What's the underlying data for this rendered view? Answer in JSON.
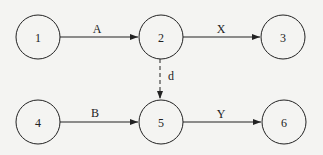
{
  "diagram": {
    "type": "activity-network",
    "colors": {
      "background": "#f4f4f2",
      "stroke": "#222222"
    },
    "nodes": [
      {
        "id": "1",
        "label": "1",
        "cx": 38,
        "cy": 37
      },
      {
        "id": "2",
        "label": "2",
        "cx": 161,
        "cy": 37
      },
      {
        "id": "3",
        "label": "3",
        "cx": 283,
        "cy": 37
      },
      {
        "id": "4",
        "label": "4",
        "cx": 38,
        "cy": 122
      },
      {
        "id": "5",
        "label": "5",
        "cx": 161,
        "cy": 122
      },
      {
        "id": "6",
        "label": "6",
        "cx": 284,
        "cy": 122
      }
    ],
    "edges": [
      {
        "from": "1",
        "to": "2",
        "label": "A",
        "style": "solid"
      },
      {
        "from": "2",
        "to": "3",
        "label": "X",
        "style": "solid"
      },
      {
        "from": "2",
        "to": "5",
        "label": "d",
        "style": "dashed"
      },
      {
        "from": "4",
        "to": "5",
        "label": "B",
        "style": "solid"
      },
      {
        "from": "5",
        "to": "6",
        "label": "Y",
        "style": "solid"
      }
    ]
  }
}
